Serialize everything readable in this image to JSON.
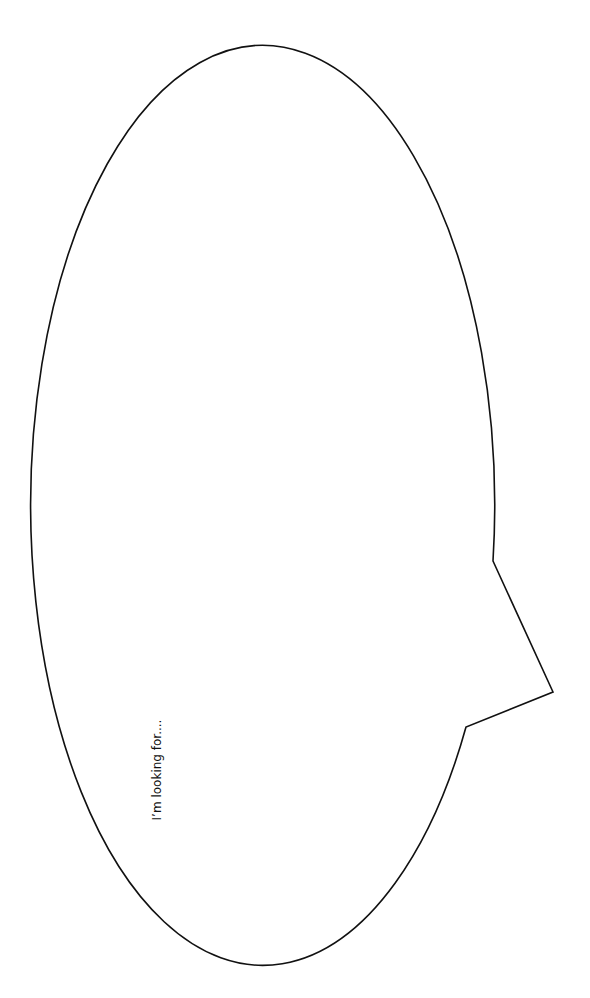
{
  "bubble": {
    "caption": "I’m looking for....",
    "stroke_color": "#111111",
    "fill_color": "#ffffff",
    "shape": "speech-bubble-ellipse-with-tail"
  }
}
